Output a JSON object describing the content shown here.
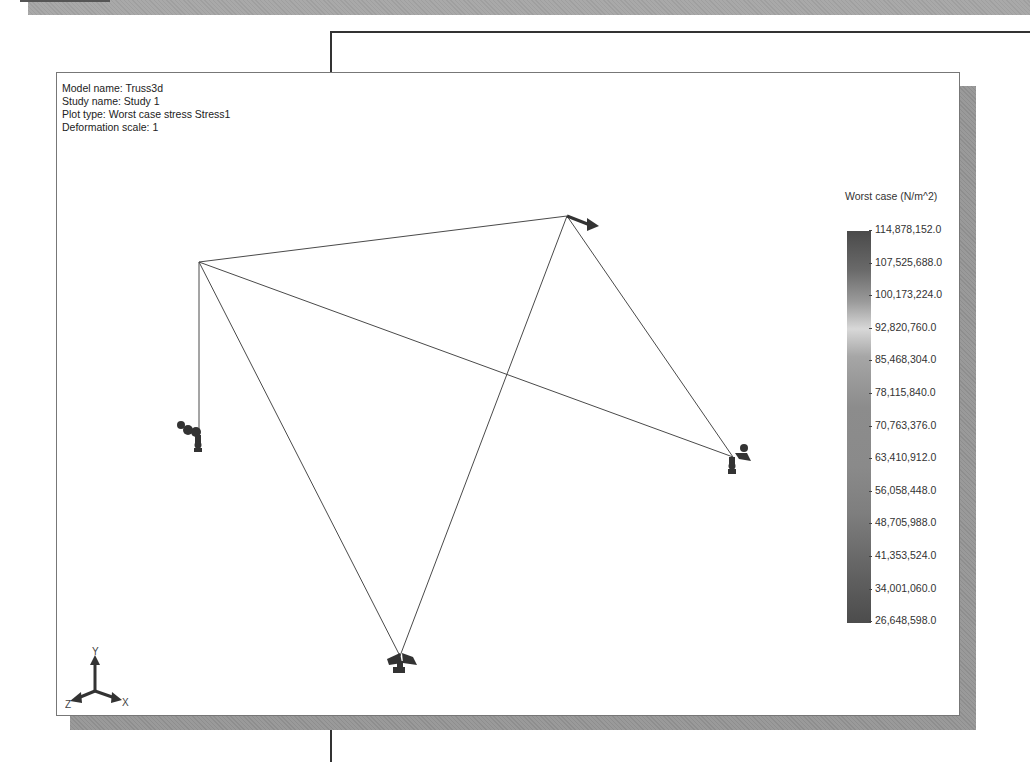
{
  "plot_info": {
    "model_name": "Model name: Truss3d",
    "study_name": "Study name: Study 1",
    "plot_type": "Plot type: Worst case stress Stress1",
    "deformation_scale": "Deformation scale: 1"
  },
  "legend": {
    "title": "Worst case (N/m^2)",
    "values": [
      "114,878,152.0",
      "107,525,688.0",
      "100,173,224.0",
      "92,820,760.0",
      "85,468,304.0",
      "78,115,840.0",
      "70,763,376.0",
      "63,410,912.0",
      "56,058,448.0",
      "48,705,988.0",
      "41,353,524.0",
      "34,001,060.0",
      "26,648,598.0"
    ]
  },
  "triad": {
    "x_label": "X",
    "y_label": "Y",
    "z_label": "Z"
  },
  "colors": {
    "background": "#ffffff",
    "frame_shadow": "#9a9a9a",
    "member_line": "#444444",
    "fixture_icon": "#333333"
  }
}
